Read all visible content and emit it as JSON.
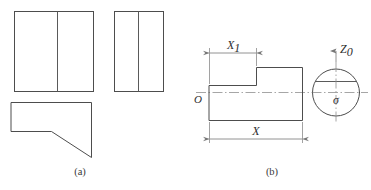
{
  "figure": {
    "background_color": "#ffffff",
    "line_color": "#4d4d4d",
    "dimension_color": "#777777",
    "text_color": "#2e2e2e"
  },
  "panel_a": {
    "caption": "(a)",
    "description": "Orthographic multi-view projection: front view, side view, and top view with angled cut",
    "views": [
      {
        "name": "front-view",
        "shape": "rectangle-with-vertical-divider",
        "x": 14,
        "y": 11,
        "width": 80,
        "height": 81,
        "divider_x": 57
      },
      {
        "name": "side-view",
        "shape": "rectangle-with-vertical-divider",
        "x": 114,
        "y": 11,
        "width": 50,
        "height": 81,
        "divider_x": 138
      },
      {
        "name": "top-view",
        "shape": "rectangle-with-angled-cut",
        "x": 11,
        "y": 102,
        "width": 81,
        "height": 55
      }
    ]
  },
  "panel_b": {
    "caption": "(b)",
    "description": "Stepped shaft profile with dimensions X1 and X, plus end circle cross-section",
    "labels": {
      "dimension_small": "X",
      "dimension_small_subscript": "1",
      "dimension_large": "X",
      "origin": "O",
      "axis_vertical": "Z",
      "axis_vertical_subscript": "0",
      "center_symbol": "σ"
    },
    "profile": {
      "name": "stepped-shaft-profile",
      "left_x": 209,
      "right_x": 302,
      "step_x": 256,
      "top_upper_y": 67,
      "top_lower_y": 85,
      "bottom_y": 120
    },
    "circle": {
      "name": "end-cross-section",
      "center_x": 336,
      "center_y": 92,
      "radius": 24,
      "chord_y": 81
    },
    "dimensions": [
      {
        "name": "x1-dimension",
        "label": "X1",
        "y": 52,
        "from_x": 209,
        "to_x": 256
      },
      {
        "name": "x-dimension",
        "label": "X",
        "y": 138,
        "from_x": 209,
        "to_x": 302
      }
    ]
  }
}
